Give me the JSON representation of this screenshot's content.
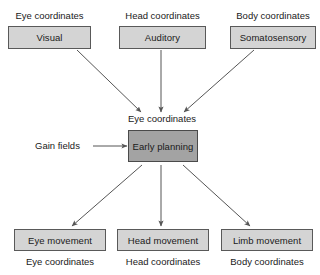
{
  "diagram": {
    "colors": {
      "box_fill": "#d4d4d4",
      "accent_box_fill": "#a3a3a3",
      "border": "#595959",
      "arrow": "#555555",
      "text": "#1a1a1a",
      "background": "#ffffff"
    },
    "inputs": [
      {
        "caption": "Eye coordinates",
        "label": "Visual"
      },
      {
        "caption": "Head coordinates",
        "label": "Auditory"
      },
      {
        "caption": "Body coordinates",
        "label": "Somatosensory"
      }
    ],
    "middle": {
      "caption": "Eye coordinates",
      "label": "Early planning",
      "modulator_label": "Gain fields"
    },
    "outputs": [
      {
        "label": "Eye movement",
        "caption": "Eye coordinates"
      },
      {
        "label": "Head movement",
        "caption": "Head coordinates"
      },
      {
        "label": "Limb movement",
        "caption": "Body coordinates"
      }
    ]
  }
}
